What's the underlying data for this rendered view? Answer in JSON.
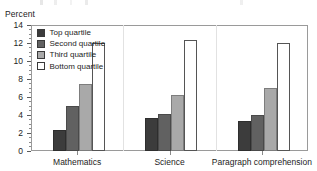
{
  "axis": {
    "y_title": "Percent",
    "y_ticks": [
      0,
      2,
      4,
      6,
      8,
      10,
      12,
      14
    ]
  },
  "legend": {
    "items": [
      {
        "label": "Top quartile",
        "color": "#3c3c3c"
      },
      {
        "label": "Second quartile",
        "color": "#616161"
      },
      {
        "label": "Third quartile",
        "color": "#a9a9a9"
      },
      {
        "label": "Bottom quartile",
        "color": "#ffffff"
      }
    ]
  },
  "chart_data": {
    "type": "bar",
    "title": "",
    "xlabel": "",
    "ylabel": "Percent",
    "ylim": [
      0,
      14
    ],
    "ytick_step": 2,
    "minor_ticks": true,
    "grid": false,
    "legend_position": "top-left-inside",
    "categories": [
      "Mathematics",
      "Science",
      "Paragraph comprehension"
    ],
    "series": [
      {
        "name": "Top quartile",
        "color": "#3c3c3c",
        "values": [
          2.3,
          3.6,
          3.3
        ]
      },
      {
        "name": "Second quartile",
        "color": "#616161",
        "values": [
          5.0,
          4.1,
          4.0
        ]
      },
      {
        "name": "Third quartile",
        "color": "#a9a9a9",
        "values": [
          7.4,
          6.2,
          7.0
        ]
      },
      {
        "name": "Bottom quartile",
        "color": "#ffffff",
        "values": [
          12.0,
          12.3,
          12.0
        ]
      }
    ]
  }
}
